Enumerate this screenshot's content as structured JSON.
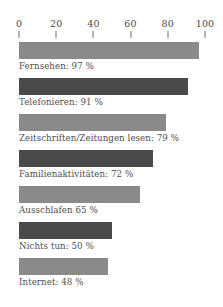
{
  "chart_data": {
    "type": "bar",
    "orientation": "horizontal",
    "title": "",
    "subtitle": "",
    "xlabel": "",
    "ylabel": "",
    "xlim": [
      0,
      100
    ],
    "grid": false,
    "legend": null,
    "unit": "%",
    "axis_ticks": [
      "0",
      "20",
      "40",
      "60",
      "80",
      "100"
    ],
    "axis_tick_values": [
      0,
      20,
      40,
      60,
      80,
      100
    ],
    "categories": [
      "Fernsehen",
      "Telefonieren",
      "Zeitschriften/Zeitungen lesen",
      "Familienaktivitäten",
      "Ausschlafen",
      "Nichts tun",
      "Internet"
    ],
    "values": [
      97,
      91,
      79,
      72,
      65,
      50,
      48
    ],
    "bars": [
      {
        "label": "Fernsehen: 97 %",
        "category": "Fernsehen",
        "value": 97,
        "color": "#8a8a8a"
      },
      {
        "label": "Telefonieren: 91 %",
        "category": "Telefonieren",
        "value": 91,
        "color": "#4a4a4a"
      },
      {
        "label": "Zeitschriften/Zeitungen lesen: 79 %",
        "category": "Zeitschriften/Zeitungen lesen",
        "value": 79,
        "color": "#8a8a8a"
      },
      {
        "label": "Familienaktivitäten: 72 %",
        "category": "Familienaktivitäten",
        "value": 72,
        "color": "#4a4a4a"
      },
      {
        "label": "Ausschlafen 65 %",
        "category": "Ausschlafen",
        "value": 65,
        "color": "#8a8a8a"
      },
      {
        "label": "Nichts tun: 50 %",
        "category": "Nichts tun",
        "value": 50,
        "color": "#4a4a4a"
      },
      {
        "label": "Internet: 48 %",
        "category": "Internet",
        "value": 48,
        "color": "#8a8a8a"
      }
    ],
    "colors": {
      "bar_light": "#8a8a8a",
      "bar_dark": "#4a4a4a",
      "text": "#4f4f4f",
      "axis": "#6e6e6e",
      "background": "#ffffff"
    }
  }
}
